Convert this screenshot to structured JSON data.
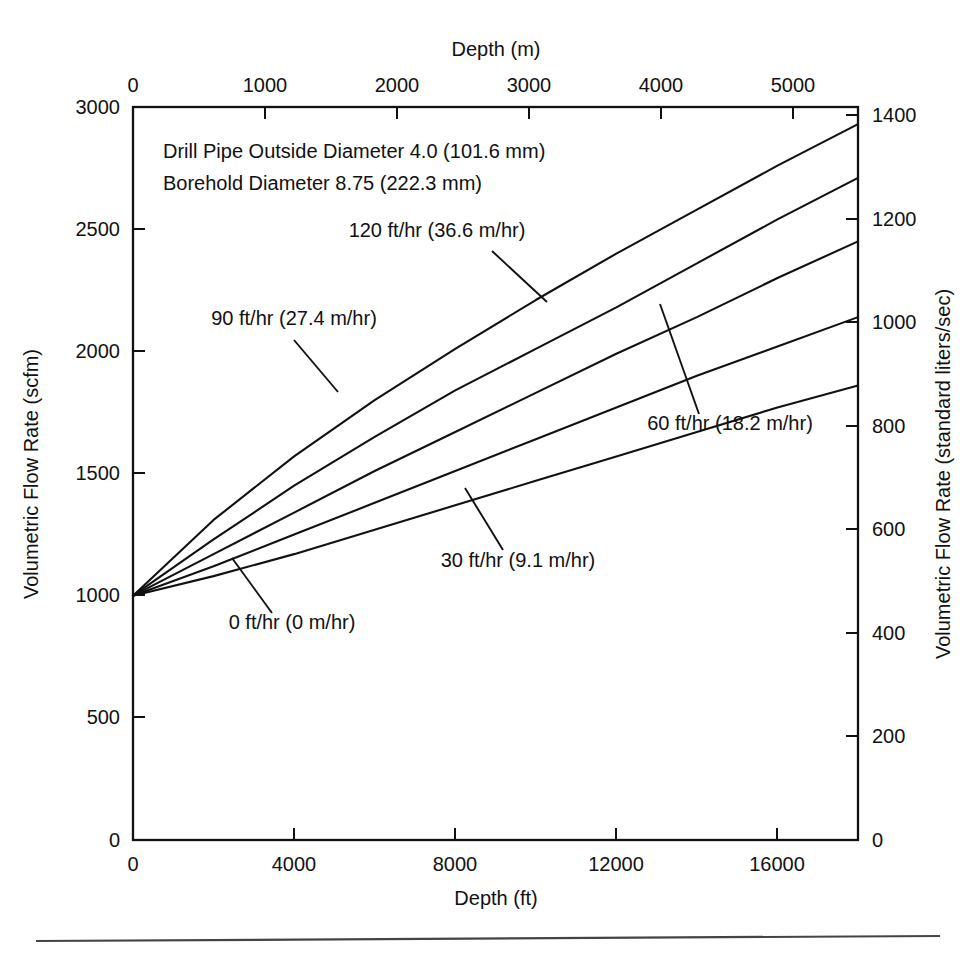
{
  "chart_data": {
    "type": "line",
    "title": "",
    "xlabel": "Depth (ft)",
    "ylabel": "Volumetric Flow Rate (scfm)",
    "x2label": "Depth (m)",
    "y2label": "Volumetric Flow Rate (standard liters/sec)",
    "xlim": [
      0,
      18000
    ],
    "ylim": [
      0,
      3000
    ],
    "x2lim": [
      0,
      5486.4
    ],
    "y2lim": [
      0,
      1416
    ],
    "xticks": [
      0,
      4000,
      8000,
      12000,
      16000
    ],
    "xticklabels": [
      "0",
      "4000",
      "8000",
      "12000",
      "16000"
    ],
    "yticks": [
      0,
      500,
      1000,
      1500,
      2000,
      2500,
      3000
    ],
    "yticklabels": [
      "0",
      "500",
      "1000",
      "1500",
      "2000",
      "2500",
      "3000"
    ],
    "x2ticks": [
      0,
      1000,
      2000,
      3000,
      4000,
      5000
    ],
    "x2ticklabels": [
      "0",
      "1000",
      "2000",
      "3000",
      "4000",
      "5000"
    ],
    "y2ticks": [
      0,
      200,
      400,
      600,
      800,
      1000,
      1200,
      1400
    ],
    "y2ticklabels": [
      "0",
      "200",
      "400",
      "600",
      "800",
      "1000",
      "1200",
      "1400"
    ],
    "grid": false,
    "legend_position": "inline-annotations",
    "line_color": "#111111",
    "annotations": [
      "Drill Pipe Outside Diameter 4.0 (101.6 mm)",
      "Borehole Diameter 8.75 (222.3 mm)"
    ],
    "x": [
      0,
      2000,
      4000,
      6000,
      8000,
      10000,
      12000,
      14000,
      16000,
      18000
    ],
    "series": [
      {
        "name": "120 ft/hr (36.6 m/hr)",
        "label": "120 ft/hr (36.6 m/hr)",
        "values": [
          1000,
          1310,
          1570,
          1800,
          2010,
          2210,
          2400,
          2580,
          2760,
          2930
        ]
      },
      {
        "name": "90 ft/hr (27.4 m/hr)",
        "label": "90 ft/hr (27.4 m/hr)",
        "values": [
          1000,
          1230,
          1450,
          1650,
          1840,
          2010,
          2180,
          2360,
          2540,
          2710
        ]
      },
      {
        "name": "60 ft/hr (18.2 m/hr)",
        "label": "60 ft/hr (18.2 m/hr)",
        "values": [
          1000,
          1170,
          1340,
          1510,
          1670,
          1830,
          1990,
          2140,
          2300,
          2450
        ]
      },
      {
        "name": "30 ft/hr (9.1 m/hr)",
        "label": "30 ft/hr (9.1 m/hr)",
        "values": [
          1000,
          1120,
          1250,
          1380,
          1510,
          1640,
          1770,
          1900,
          2020,
          2140
        ]
      },
      {
        "name": "0 ft/hr (0 m/hr)",
        "label": "0 ft/hr (0 m/hr)",
        "values": [
          1000,
          1080,
          1170,
          1270,
          1370,
          1470,
          1570,
          1670,
          1770,
          1860
        ]
      }
    ]
  },
  "labels": {
    "curve_120": "120 ft/hr (36.6 m/hr)",
    "curve_90": "90 ft/hr (27.4 m/hr)",
    "curve_60": "60 ft/hr (18.2 m/hr)",
    "curve_30": "30 ft/hr (9.1 m/hr)",
    "curve_0": "0 ft/hr (0 m/hr)",
    "note_1": "Drill Pipe Outside Diameter 4.0 (101.6 mm)",
    "note_2": "Borehold Diameter 8.75 (222.3 mm)",
    "x_title": "Depth (ft)",
    "x2_title": "Depth (m)",
    "y_title": "Volumetric Flow Rate (scfm)",
    "y2_title": "Volumetric Flow Rate (standard liters/sec)"
  },
  "ticks": {
    "bottom": [
      "0",
      "4000",
      "8000",
      "12000",
      "16000"
    ],
    "top": [
      "0",
      "1000",
      "2000",
      "3000",
      "4000",
      "5000"
    ],
    "left": [
      "3000",
      "2500",
      "2000",
      "1500",
      "1000",
      "500",
      "0"
    ],
    "right": [
      "1400",
      "1200",
      "1000",
      "800",
      "600",
      "400",
      "200",
      "0"
    ]
  }
}
